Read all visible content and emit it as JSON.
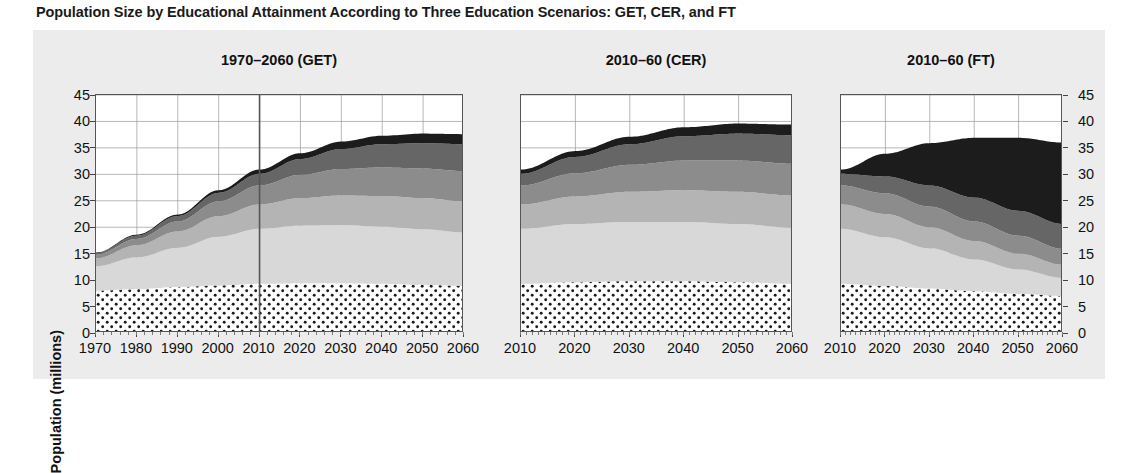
{
  "figure": {
    "title": "Population Size by Educational Attainment According to Three Education Scenarios: GET, CER, and FT",
    "ylabel": "Population (millions)",
    "background": "#ececec",
    "plot_background": "#ffffff"
  },
  "chart_data": {
    "type": "area",
    "title": "Population Size by Educational Attainment According to Three Education Scenarios: GET, CER, and FT",
    "xlabel": "",
    "ylabel": "Population (millions)",
    "ylim": [
      0,
      45
    ],
    "yticks": [
      0,
      5,
      10,
      15,
      20,
      25,
      30,
      35,
      40,
      45
    ],
    "ytick_labels": [
      "0",
      "5",
      "10",
      "15",
      "20",
      "25",
      "30",
      "35",
      "40",
      "45"
    ],
    "grid": true,
    "stacked": true,
    "legend_position": "none",
    "series_order_bottom_to_top": [
      "Under 15 / No education",
      "Incomplete primary",
      "Primary",
      "Lower secondary",
      "Upper secondary",
      "Post-secondary"
    ],
    "series_colors": [
      "#ffffff-dotted",
      "#d6d6d6",
      "#b3b3b3",
      "#8e8e8e",
      "#6a6a6a",
      "#1e1e1e"
    ],
    "panels": [
      {
        "name": "GET",
        "title": "1970–2060 (GET)",
        "xlim": [
          1970,
          2060
        ],
        "xticks": [
          1970,
          1980,
          1990,
          2000,
          2010,
          2020,
          2030,
          2040,
          2050,
          2060
        ],
        "xtick_labels": [
          "1970",
          "1980",
          "1990",
          "2000",
          "2010",
          "2020",
          "2030",
          "2040",
          "2050",
          "2060"
        ],
        "marker_line_x": 2010,
        "x": [
          1970,
          1980,
          1990,
          2000,
          2010,
          2020,
          2030,
          2040,
          2050,
          2060
        ],
        "series": [
          {
            "name": "Under 15 / No education",
            "values": [
              8.0,
              8.3,
              8.7,
              9.0,
              9.3,
              9.4,
              9.4,
              9.3,
              9.1,
              8.9
            ]
          },
          {
            "name": "Incomplete primary",
            "values": [
              4.6,
              6.0,
              7.4,
              9.2,
              10.4,
              10.9,
              11.0,
              10.8,
              10.5,
              10.1
            ]
          },
          {
            "name": "Primary",
            "values": [
              1.5,
              2.3,
              3.1,
              3.9,
              4.6,
              5.2,
              5.6,
              5.8,
              5.9,
              5.9
            ]
          },
          {
            "name": "Lower secondary",
            "values": [
              0.7,
              1.2,
              1.9,
              2.8,
              3.6,
              4.4,
              5.0,
              5.4,
              5.6,
              5.7
            ]
          },
          {
            "name": "Upper secondary",
            "values": [
              0.3,
              0.6,
              1.0,
              1.6,
              2.2,
              3.0,
              3.8,
              4.4,
              4.8,
              5.1
            ]
          },
          {
            "name": "Post-secondary",
            "values": [
              0.1,
              0.2,
              0.3,
              0.5,
              0.8,
              1.1,
              1.4,
              1.6,
              1.8,
              1.9
            ]
          }
        ],
        "totals": [
          15.2,
          18.6,
          22.4,
          27.0,
          30.9,
          34.0,
          36.2,
          37.3,
          37.7,
          37.6
        ]
      },
      {
        "name": "CER",
        "title": "2010–60 (CER)",
        "xlim": [
          2010,
          2060
        ],
        "xticks": [
          2010,
          2020,
          2030,
          2040,
          2050,
          2060
        ],
        "xtick_labels": [
          "2010",
          "2020",
          "2030",
          "2040",
          "2050",
          "2060"
        ],
        "marker_line_x": null,
        "x": [
          2010,
          2020,
          2030,
          2040,
          2050,
          2060
        ],
        "series": [
          {
            "name": "Under 15 / No education",
            "values": [
              9.3,
              9.6,
              9.8,
              9.8,
              9.6,
              9.3
            ]
          },
          {
            "name": "Incomplete primary",
            "values": [
              10.4,
              11.0,
              11.2,
              11.2,
              11.0,
              10.6
            ]
          },
          {
            "name": "Primary",
            "values": [
              4.6,
              5.2,
              5.7,
              6.0,
              6.1,
              6.1
            ]
          },
          {
            "name": "Lower secondary",
            "values": [
              3.6,
              4.4,
              5.1,
              5.6,
              5.9,
              6.0
            ]
          },
          {
            "name": "Upper secondary",
            "values": [
              2.2,
              3.1,
              3.9,
              4.6,
              5.1,
              5.4
            ]
          },
          {
            "name": "Post-secondary",
            "values": [
              0.8,
              1.1,
              1.4,
              1.7,
              1.9,
              2.0
            ]
          }
        ],
        "totals": [
          30.9,
          34.4,
          37.1,
          38.9,
          39.6,
          39.4
        ]
      },
      {
        "name": "FT",
        "title": "2010–60 (FT)",
        "xlim": [
          2010,
          2060
        ],
        "xticks": [
          2010,
          2020,
          2030,
          2040,
          2050,
          2060
        ],
        "xtick_labels": [
          "2010",
          "2020",
          "2030",
          "2040",
          "2050",
          "2060"
        ],
        "marker_line_x": null,
        "x": [
          2010,
          2020,
          2030,
          2040,
          2050,
          2060
        ],
        "series": [
          {
            "name": "Under 15 / No education",
            "values": [
              9.3,
              8.9,
              8.4,
              7.9,
              7.4,
              7.0
            ]
          },
          {
            "name": "Incomplete primary",
            "values": [
              10.4,
              9.2,
              7.6,
              6.0,
              4.6,
              3.4
            ]
          },
          {
            "name": "Primary",
            "values": [
              4.6,
              4.4,
              4.0,
              3.5,
              3.0,
              2.5
            ]
          },
          {
            "name": "Lower secondary",
            "values": [
              3.6,
              3.9,
              3.9,
              3.7,
              3.4,
              3.0
            ]
          },
          {
            "name": "Upper secondary",
            "values": [
              2.2,
              3.2,
              4.0,
              4.5,
              4.7,
              4.7
            ]
          },
          {
            "name": "Post-secondary",
            "values": [
              0.8,
              4.3,
              8.0,
              11.3,
              13.8,
              15.4
            ]
          }
        ],
        "totals": [
          30.9,
          33.9,
          35.9,
          36.9,
          36.9,
          36.0
        ]
      }
    ]
  },
  "axes": {
    "ylabel": "Population (millions)",
    "ytick_labels_left": [
      "45",
      "40",
      "35",
      "30",
      "25",
      "20",
      "15",
      "10",
      "5",
      "0"
    ],
    "ytick_labels_right": [
      "45",
      "40",
      "35",
      "30",
      "25",
      "20",
      "15",
      "10",
      "5",
      "0"
    ]
  }
}
